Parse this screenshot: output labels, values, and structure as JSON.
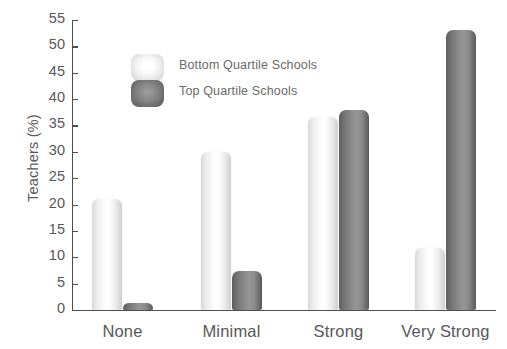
{
  "chart_data": {
    "type": "bar",
    "title": "",
    "xlabel": "",
    "ylabel": "Teachers (%)",
    "ylim": [
      0,
      55
    ],
    "ytick_step": 5,
    "grid": false,
    "legend_position": "upper-left-inside",
    "categories": [
      "None",
      "Minimal",
      "Strong",
      "Very Strong"
    ],
    "yticks": [
      "0",
      "5",
      "10",
      "15",
      "20",
      "25",
      "30",
      "35",
      "40",
      "45",
      "50",
      "55"
    ],
    "series": [
      {
        "name": "Bottom Quartile Schools",
        "color": "#f2f2f2",
        "values": [
          21,
          30,
          36.7,
          11.7
        ]
      },
      {
        "name": "Top Quartile Schools",
        "color": "#808080",
        "values": [
          1.3,
          7.4,
          38,
          53.2
        ]
      }
    ]
  },
  "axis": {
    "y_title": "Teachers (%)"
  },
  "legend": {
    "items": [
      {
        "label": "Bottom Quartile Schools",
        "swatch": "light"
      },
      {
        "label": "Top Quartile Schools",
        "swatch": "dark"
      }
    ]
  }
}
